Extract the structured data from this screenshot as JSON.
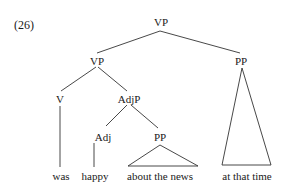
{
  "example_number": "(26)",
  "tree": {
    "root": {
      "label": "VP"
    },
    "vp_left": {
      "label": "VP"
    },
    "pp_right": {
      "label": "PP"
    },
    "v": {
      "label": "V"
    },
    "adjp": {
      "label": "AdjP"
    },
    "adj": {
      "label": "Adj"
    },
    "pp_mid": {
      "label": "PP"
    },
    "leaves": {
      "was": "was",
      "happy": "happy",
      "about_the_news": "about the news",
      "at_that_time": "at that time"
    }
  },
  "colors": {
    "line": "#333333",
    "text": "#1a1a1a",
    "background": "#ffffff"
  }
}
